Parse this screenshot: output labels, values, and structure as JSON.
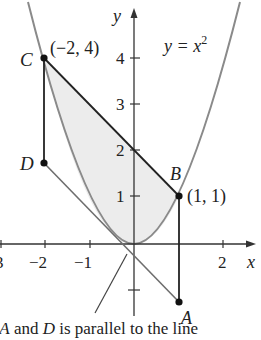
{
  "figure": {
    "curve_label": "y = x",
    "curve_exp": "2",
    "axis_x_label": "x",
    "axis_y_label": "y",
    "x_ticks": [
      {
        "value": -3,
        "label": "3"
      },
      {
        "value": -2,
        "label": "−2"
      },
      {
        "value": -1,
        "label": "−1"
      },
      {
        "value": 2,
        "label": "2"
      }
    ],
    "y_ticks": [
      {
        "value": 4,
        "label": "4"
      },
      {
        "value": 3,
        "label": "3"
      },
      {
        "value": 2,
        "label": "2"
      },
      {
        "value": 1,
        "label": "1"
      }
    ],
    "points": {
      "A": {
        "label": "A",
        "x": 1,
        "y": -2.3
      },
      "B": {
        "label": "B",
        "x": 1,
        "y": 1,
        "coord_label": "(1, 1)"
      },
      "C": {
        "label": "C",
        "x": -2,
        "y": 4,
        "coord_label": "(−2, 4)"
      },
      "D": {
        "label": "D",
        "x": -2,
        "y": 1.75
      }
    },
    "colors": {
      "curve": "#8a8a8a",
      "lines": "#222222",
      "shade": "#ececec",
      "tangent": "#6e6e6e"
    }
  },
  "caption": {
    "prefix": "ng ",
    "a": "A",
    "mid": " and ",
    "d": "D",
    "suffix": " is parallel to the line"
  }
}
